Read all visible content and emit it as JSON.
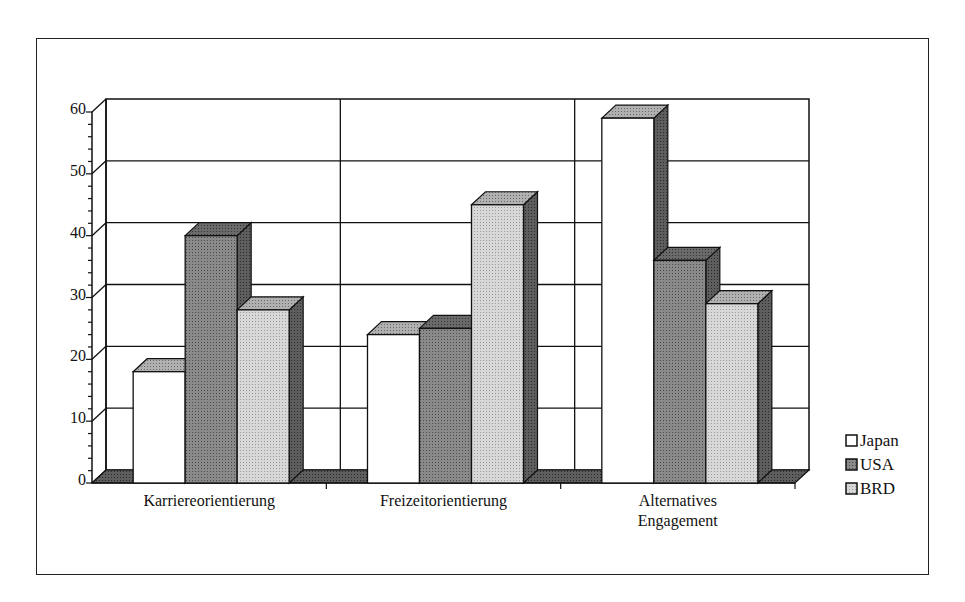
{
  "chart_data": {
    "type": "bar",
    "style": "3d-clustered",
    "title": "",
    "xlabel": "",
    "ylabel": "",
    "ylim": [
      0,
      60
    ],
    "yticks": [
      0,
      10,
      20,
      30,
      40,
      50,
      60
    ],
    "grid": true,
    "legend_position": "right",
    "categories": [
      "Karriereorientierung",
      "Freizeitorientierung",
      "Alternatives Engagement"
    ],
    "category_label_lines": [
      [
        "Karriereorientierung"
      ],
      [
        "Freizeitorientierung"
      ],
      [
        "Alternatives",
        "Engagement"
      ]
    ],
    "series": [
      {
        "name": "Japan",
        "values": [
          18,
          24,
          59
        ],
        "color": "#ffffff",
        "side_color": "#5a5a5a",
        "top_color": "#a8a8a8"
      },
      {
        "name": "USA",
        "values": [
          40,
          25,
          36
        ],
        "color": "#7a7a7a",
        "side_color": "#4a4a4a",
        "top_color": "#5e5e5e"
      },
      {
        "name": "BRD",
        "values": [
          28,
          45,
          29
        ],
        "color": "#cfcfcf",
        "side_color": "#5a5a5a",
        "top_color": "#a0a0a0"
      }
    ]
  }
}
